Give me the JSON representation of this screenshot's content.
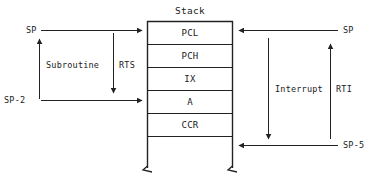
{
  "diagram": {
    "title": "Stack",
    "stack_cells": [
      {
        "label": "PCL"
      },
      {
        "label": "PCH"
      },
      {
        "label": "IX"
      },
      {
        "label": "A"
      },
      {
        "label": "CCR"
      }
    ],
    "left_side": {
      "top_pointer_label": "SP",
      "bottom_pointer_label": "SP-2",
      "up_arrow_label": "Subroutine",
      "down_arrow_label": "RTS"
    },
    "right_side": {
      "top_pointer_label": "SP",
      "bottom_pointer_label": "SP-5",
      "down_arrow_label": "Interrupt",
      "up_arrow_label": "RTI"
    },
    "colors": {
      "line": "#222222",
      "text": "#1a1a1a",
      "background": "#ffffff"
    }
  }
}
